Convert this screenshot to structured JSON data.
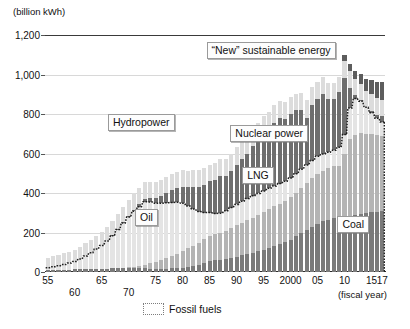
{
  "chart_data": {
    "type": "bar",
    "stacked": true,
    "title": "",
    "subtitle": "",
    "unit_label": "(billion kWh)",
    "xlabel": "(fiscal year)",
    "ylabel": "",
    "ylim": [
      0,
      1200
    ],
    "yticks": [
      0,
      200,
      400,
      600,
      800,
      1000,
      1200
    ],
    "ytick_labels": [
      "0",
      "200",
      "400",
      "600",
      "800",
      "1,000",
      "1,200"
    ],
    "grid": true,
    "legend_position": "bottom",
    "legend": [
      {
        "label": "Fossil fuels",
        "style": "dotted-outline"
      }
    ],
    "annotations": [
      {
        "text": "“New” sustainable energy",
        "x_pct": 47.5,
        "y_pct": 3.0
      },
      {
        "text": "Hydropower",
        "x_pct": 18.5,
        "y_pct": 33.5
      },
      {
        "text": "Nuclear power",
        "x_pct": 54.5,
        "y_pct": 38.0
      },
      {
        "text": "LNG",
        "x_pct": 58.0,
        "y_pct": 55.5
      },
      {
        "text": "Oil",
        "x_pct": 26.5,
        "y_pct": 73.5
      },
      {
        "text": "Coal",
        "x_pct": 86.0,
        "y_pct": 76.5
      }
    ],
    "x": [
      "55",
      "56",
      "57",
      "58",
      "59",
      "60",
      "61",
      "62",
      "63",
      "64",
      "65",
      "66",
      "67",
      "68",
      "69",
      "70",
      "71",
      "72",
      "73",
      "74",
      "75",
      "76",
      "77",
      "78",
      "79",
      "80",
      "81",
      "82",
      "83",
      "84",
      "85",
      "86",
      "87",
      "88",
      "89",
      "90",
      "91",
      "92",
      "93",
      "94",
      "95",
      "96",
      "97",
      "98",
      "99",
      "2000",
      "01",
      "02",
      "03",
      "04",
      "05",
      "06",
      "07",
      "08",
      "09",
      "10",
      "11",
      "12",
      "13",
      "14",
      "15",
      "16",
      "17"
    ],
    "xtick_labels_row1": [
      "55",
      "65",
      "75",
      "80",
      "85",
      "90",
      "95",
      "2000",
      "05",
      "10",
      "15",
      "17"
    ],
    "xtick_labels_row2": [
      "60",
      "70"
    ],
    "series": [
      {
        "name": "Coal",
        "color": "#7a7a7a",
        "values": [
          8,
          9,
          10,
          11,
          12,
          13,
          14,
          15,
          15,
          16,
          16,
          17,
          18,
          19,
          20,
          21,
          20,
          19,
          18,
          17,
          16,
          16,
          17,
          18,
          19,
          20,
          24,
          29,
          36,
          45,
          55,
          60,
          62,
          66,
          72,
          78,
          84,
          90,
          96,
          104,
          112,
          122,
          132,
          142,
          152,
          164,
          180,
          196,
          212,
          228,
          244,
          256,
          264,
          272,
          252,
          276,
          282,
          288,
          294,
          298,
          302,
          305,
          307
        ]
      },
      {
        "name": "LNG",
        "color": "#b4b4b4",
        "values": [
          0,
          0,
          0,
          0,
          0,
          0,
          0,
          0,
          0,
          0,
          0,
          0,
          0,
          0,
          0,
          2,
          6,
          12,
          20,
          28,
          36,
          44,
          52,
          62,
          72,
          84,
          96,
          104,
          112,
          120,
          128,
          132,
          136,
          142,
          150,
          158,
          166,
          172,
          178,
          184,
          190,
          196,
          200,
          204,
          208,
          214,
          222,
          230,
          238,
          246,
          254,
          258,
          262,
          266,
          284,
          320,
          390,
          408,
          410,
          402,
          396,
          388,
          380
        ]
      },
      {
        "name": "Oil",
        "color": "#e4e4e4",
        "values": [
          14,
          18,
          22,
          27,
          33,
          40,
          52,
          66,
          82,
          100,
          118,
          140,
          166,
          196,
          228,
          256,
          282,
          300,
          318,
          310,
          296,
          288,
          282,
          272,
          262,
          244,
          214,
          186,
          158,
          136,
          118,
          104,
          100,
          102,
          104,
          106,
          108,
          110,
          112,
          110,
          108,
          106,
          104,
          102,
          100,
          98,
          96,
          94,
          92,
          90,
          88,
          84,
          80,
          78,
          96,
          100,
          158,
          182,
          160,
          134,
          108,
          86,
          72
        ]
      },
      {
        "name": "Nuclear power",
        "color": "#6e6e6e",
        "values": [
          0,
          0,
          0,
          0,
          0,
          0,
          0,
          0,
          0,
          0,
          0,
          1,
          2,
          3,
          4,
          5,
          8,
          12,
          16,
          20,
          26,
          36,
          48,
          62,
          74,
          84,
          98,
          110,
          124,
          138,
          158,
          170,
          188,
          178,
          184,
          202,
          214,
          224,
          250,
          268,
          292,
          302,
          320,
          332,
          316,
          322,
          320,
          300,
          240,
          282,
          290,
          304,
          268,
          260,
          280,
          288,
          102,
          16,
          9,
          0,
          9,
          18,
          32
        ]
      },
      {
        "name": "Hydropower",
        "color": "#dcdcdc",
        "values": [
          50,
          52,
          54,
          56,
          58,
          60,
          62,
          64,
          66,
          68,
          70,
          72,
          74,
          76,
          78,
          80,
          82,
          84,
          82,
          80,
          82,
          84,
          82,
          80,
          82,
          84,
          82,
          86,
          88,
          86,
          84,
          86,
          84,
          86,
          88,
          90,
          92,
          94,
          92,
          90,
          88,
          86,
          88,
          86,
          84,
          86,
          84,
          88,
          90,
          92,
          86,
          84,
          82,
          80,
          78,
          84,
          86,
          82,
          80,
          82,
          84,
          82,
          80
        ]
      },
      {
        "name": "“New” sustainable energy",
        "color": "#5d5d5d",
        "values": [
          0,
          0,
          0,
          0,
          0,
          0,
          0,
          0,
          0,
          0,
          0,
          0,
          0,
          0,
          0,
          0,
          0,
          0,
          0,
          0,
          0,
          0,
          0,
          0,
          0,
          0,
          0,
          0,
          0,
          0,
          0,
          0,
          0,
          0,
          0,
          0,
          0,
          0,
          0,
          0,
          0,
          0,
          0,
          0,
          0,
          0,
          0,
          0,
          0,
          0,
          0,
          0,
          0,
          0,
          0,
          30,
          34,
          40,
          48,
          60,
          72,
          82,
          92
        ]
      }
    ],
    "fossil_total": [
      22,
      27,
      32,
      38,
      45,
      53,
      66,
      81,
      97,
      116,
      134,
      157,
      184,
      215,
      248,
      279,
      308,
      331,
      356,
      355,
      348,
      348,
      351,
      352,
      353,
      348,
      334,
      319,
      306,
      301,
      301,
      296,
      298,
      310,
      326,
      342,
      358,
      372,
      386,
      398,
      410,
      424,
      436,
      448,
      460,
      476,
      498,
      520,
      542,
      564,
      586,
      598,
      606,
      616,
      632,
      696,
      830,
      878,
      864,
      834,
      806,
      779,
      759
    ]
  }
}
